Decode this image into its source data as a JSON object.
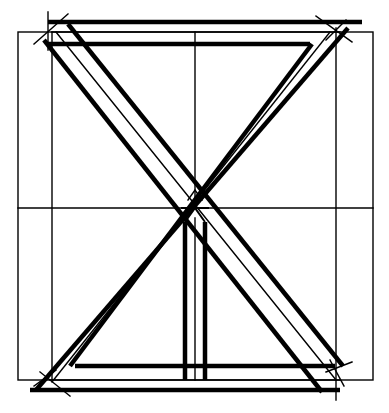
{
  "diagram": {
    "type": "structural-frame-sketch",
    "description": "Square frame with X-shaped diagonal cross bracing, double-banded top and bottom rails, and a center vertical post, drawn in black ink line art",
    "colors": {
      "ink": "#000000",
      "paper": "#ffffff"
    },
    "components": [
      {
        "name": "outer-guide-rectangle",
        "style": "thin"
      },
      {
        "name": "inner-guide-verticals",
        "style": "thin"
      },
      {
        "name": "horizontal-center-guide",
        "style": "thin"
      },
      {
        "name": "top-rail",
        "style": "double-band"
      },
      {
        "name": "bottom-rail",
        "style": "double-band"
      },
      {
        "name": "diagonal-brace-tl-br",
        "style": "triple-line-band"
      },
      {
        "name": "diagonal-brace-tr-bl",
        "style": "triple-line-band"
      },
      {
        "name": "center-post",
        "style": "double-band-lower-half"
      },
      {
        "name": "corner-crossing-marks",
        "style": "thin-ticks"
      }
    ]
  }
}
